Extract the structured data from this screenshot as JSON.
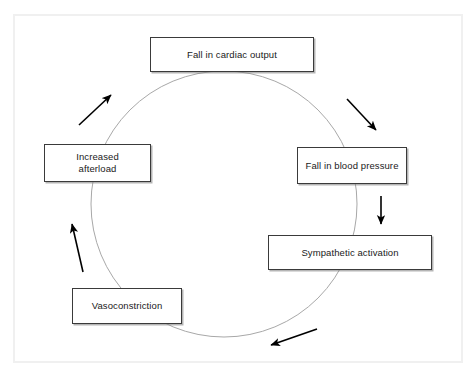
{
  "diagram": {
    "frame": {
      "border_color": "#f0f0f0",
      "background": "#ffffff"
    },
    "cycle_ring": {
      "shape": "circle",
      "center_x": 224,
      "center_y": 204,
      "radius": 133,
      "stroke_color": "#a8a8a8",
      "stroke_width": 1
    },
    "nodes": [
      {
        "id": "cardiac-output",
        "label": "Fall in cardiac output",
        "position": "top"
      },
      {
        "id": "blood-pressure",
        "label": "Fall in blood pressure",
        "position": "right"
      },
      {
        "id": "sympathetic-activation",
        "label": "Sympathetic activation",
        "position": "bottom-right"
      },
      {
        "id": "vasoconstriction",
        "label": "Vasoconstriction",
        "position": "bottom-left"
      },
      {
        "id": "increased-afterload",
        "label": "Increased\nafterload",
        "position": "left"
      }
    ],
    "arrows": [
      {
        "id": "arrow-cardiac-output-to-blood-pressure",
        "direction": "down-right",
        "x1": 347,
        "y1": 99,
        "x2": 376,
        "y2": 130,
        "color": "#000000"
      },
      {
        "id": "arrow-blood-pressure-to-sympathetic",
        "direction": "down",
        "x1": 381,
        "y1": 196,
        "x2": 381,
        "y2": 224,
        "color": "#000000"
      },
      {
        "id": "arrow-sympathetic-to-vasoconstriction",
        "direction": "down-left",
        "x1": 317,
        "y1": 329,
        "x2": 271,
        "y2": 345,
        "color": "#000000"
      },
      {
        "id": "arrow-vasoconstriction-to-afterload",
        "direction": "up",
        "x1": 83,
        "y1": 272,
        "x2": 72,
        "y2": 224,
        "color": "#000000"
      },
      {
        "id": "arrow-afterload-to-cardiac-output",
        "direction": "up-right",
        "x1": 79,
        "y1": 125,
        "x2": 111,
        "y2": 95,
        "color": "#000000"
      }
    ]
  }
}
